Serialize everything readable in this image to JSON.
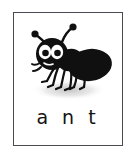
{
  "card": {
    "word": "a n t",
    "border_color": "#4a4a52",
    "background_color": "#ffffff"
  },
  "illustration": {
    "subject": "ant",
    "style": "cartoon clip-art",
    "ink_color": "#101010",
    "eye_color": "#ffffff",
    "shadow_color": "#c9c9c9",
    "parts": [
      "left-antenna",
      "right-antenna",
      "head",
      "left-eye",
      "right-eye",
      "mandibles",
      "thorax",
      "abdomen",
      "front-left-leg",
      "front-right-leg",
      "middle-left-leg",
      "middle-right-leg",
      "hind-left-leg",
      "hind-right-leg",
      "ground-shadow"
    ]
  }
}
